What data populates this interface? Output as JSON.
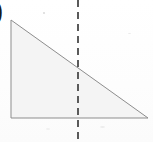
{
  "figure": {
    "corner_label": ")",
    "background_color": "#ffffff",
    "shape": {
      "name": "right-triangle",
      "fill_color": "#f4f4f4",
      "stroke_color": "#8d8d8d",
      "stroke_width": 1,
      "vertices": [
        {
          "label": "top-left",
          "x": 11,
          "y": 20
        },
        {
          "label": "bottom-right",
          "x": 148,
          "y": 118
        },
        {
          "label": "bottom-left",
          "x": 11,
          "y": 118
        }
      ],
      "right_angle_at": "bottom-left"
    },
    "dashed_line": {
      "name": "vertical-dashed-line",
      "orientation": "vertical",
      "x": 78,
      "y_start": 0,
      "y_end": 139,
      "stroke_color": "#5a5a5a",
      "stroke_width": 2,
      "dash_length": 7,
      "gap_length": 5
    }
  },
  "chart_data": {
    "type": "scatter",
    "xlabel": "",
    "ylabel": "",
    "xlim": [
      0,
      153
    ],
    "ylim": [
      0,
      142
    ],
    "grid": false,
    "legend": "none",
    "series": [
      {
        "name": "triangle-outline",
        "closed": true,
        "x": [
          11,
          148,
          11
        ],
        "y": [
          20,
          118,
          118
        ]
      },
      {
        "name": "vertical-dashed-line",
        "closed": false,
        "x": [
          78,
          78
        ],
        "y": [
          0,
          139
        ]
      }
    ],
    "annotations": [
      {
        "text": ")",
        "x": 2,
        "y": 10
      }
    ]
  }
}
